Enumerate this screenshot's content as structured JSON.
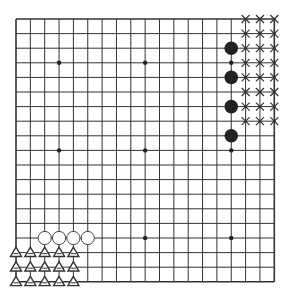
{
  "board": {
    "size": 19,
    "origin_x": 16,
    "origin_y": 19,
    "step_x": 14.35,
    "step_y": 14.6,
    "line_color": "#333333",
    "background": "#ffffff"
  },
  "star_points": [
    [
      3,
      3
    ],
    [
      9,
      3
    ],
    [
      15,
      3
    ],
    [
      3,
      9
    ],
    [
      9,
      9
    ],
    [
      15,
      9
    ],
    [
      3,
      15
    ],
    [
      9,
      15
    ],
    [
      15,
      15
    ]
  ],
  "black_stones": [
    [
      15,
      2
    ],
    [
      15,
      4
    ],
    [
      15,
      6
    ],
    [
      15,
      8
    ]
  ],
  "white_stones": [
    [
      2,
      15
    ],
    [
      3,
      15
    ],
    [
      4,
      15
    ],
    [
      5,
      15
    ]
  ],
  "x_marks": {
    "cols": [
      16,
      17,
      18
    ],
    "rows": [
      0,
      1,
      2,
      3,
      4,
      5,
      6,
      7
    ]
  },
  "triangle_marks": {
    "cols": [
      0,
      1,
      2,
      3,
      4
    ],
    "rows": [
      16,
      17,
      18
    ]
  },
  "colors": {
    "black_stone": "#222222",
    "white_stone_fill": "#ffffff",
    "white_stone_stroke": "#444444",
    "mark": "#333333"
  }
}
